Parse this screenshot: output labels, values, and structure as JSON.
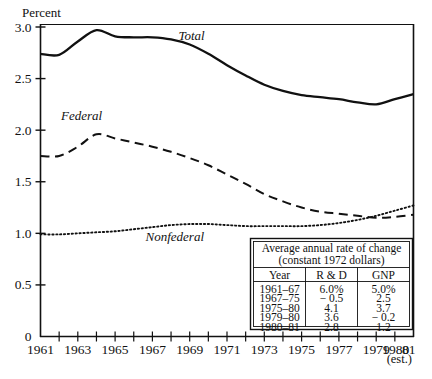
{
  "chart_data": {
    "type": "line",
    "title": "",
    "ylabel": "Percent",
    "xlabel": "",
    "ylim": [
      0,
      3.0
    ],
    "yticks": [
      "0",
      "0.5",
      "1.0",
      "1.5",
      "2.0",
      "2.5",
      "3.0"
    ],
    "ytick_values": [
      0,
      0.5,
      1.0,
      1.5,
      2.0,
      2.5,
      3.0
    ],
    "xlim": [
      1961,
      1981
    ],
    "xticks": [
      "1961",
      "1963",
      "1965",
      "1967",
      "1969",
      "1971",
      "1973",
      "1975",
      "1977",
      "1979",
      "1980",
      "81"
    ],
    "xtick_values": [
      1961,
      1963,
      1965,
      1967,
      1969,
      1971,
      1973,
      1975,
      1977,
      1979,
      1980,
      1981
    ],
    "xtick_note": "(est.)",
    "grid": false,
    "legend_position": "inline-annotations",
    "x": [
      1961,
      1962,
      1963,
      1964,
      1965,
      1966,
      1967,
      1968,
      1969,
      1970,
      1971,
      1972,
      1973,
      1974,
      1975,
      1976,
      1977,
      1978,
      1979,
      1980,
      1981
    ],
    "series": [
      {
        "name": "Total",
        "style": "solid",
        "values": [
          2.74,
          2.73,
          2.86,
          2.97,
          2.91,
          2.9,
          2.9,
          2.88,
          2.83,
          2.74,
          2.63,
          2.53,
          2.44,
          2.38,
          2.34,
          2.32,
          2.3,
          2.27,
          2.25,
          2.3,
          2.35
        ]
      },
      {
        "name": "Federal",
        "style": "dashed",
        "values": [
          1.75,
          1.75,
          1.84,
          1.96,
          1.92,
          1.88,
          1.84,
          1.79,
          1.73,
          1.66,
          1.57,
          1.48,
          1.38,
          1.31,
          1.25,
          1.21,
          1.19,
          1.17,
          1.15,
          1.16,
          1.18
        ]
      },
      {
        "name": "Nonfederal",
        "style": "dotted",
        "values": [
          0.99,
          0.99,
          1.0,
          1.01,
          1.02,
          1.04,
          1.06,
          1.08,
          1.09,
          1.09,
          1.08,
          1.07,
          1.07,
          1.07,
          1.07,
          1.08,
          1.1,
          1.13,
          1.17,
          1.22,
          1.27
        ]
      }
    ],
    "annotations": [
      {
        "text": "Total",
        "x": 1969.1,
        "y": 2.87
      },
      {
        "text": "Federal",
        "x": 1963.2,
        "y": 2.1
      },
      {
        "text": "Nonfederal",
        "x": 1968.2,
        "y": 0.93
      }
    ]
  },
  "table": {
    "title_line1": "Average annual rate of change",
    "title_line2": "(constant 1972 dollars)",
    "columns": [
      "Year",
      "R & D",
      "GNP"
    ],
    "rows": [
      [
        "1961–67",
        "6.0%",
        "5.0%"
      ],
      [
        "1967–75",
        "− 0.5",
        "2.5"
      ],
      [
        "1975–80",
        "4.1",
        "3.7"
      ],
      [
        "1979–80",
        "3.6",
        "− 0.2"
      ],
      [
        "1980–81",
        "2.8",
        "1.2"
      ]
    ]
  },
  "colors": {
    "ink": "#111111",
    "background": "#ffffff"
  }
}
